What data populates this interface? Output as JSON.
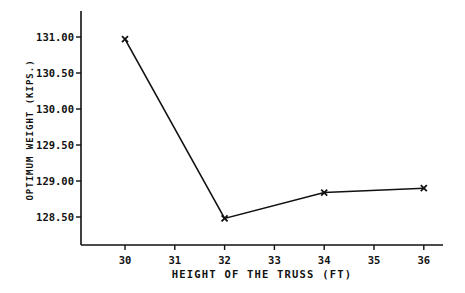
{
  "chart_data": {
    "type": "line",
    "title": "",
    "xlabel": "HEIGHT OF THE TRUSS (FT)",
    "ylabel": "OPTIMUM WEIGHT (KIPS.)",
    "x": [
      30,
      32,
      34,
      36
    ],
    "series": [
      {
        "name": "Optimum weight",
        "values": [
          130.97,
          128.48,
          128.84,
          128.9
        ],
        "marker": "x"
      }
    ],
    "xticks": [
      30,
      31,
      32,
      33,
      34,
      35,
      36
    ],
    "xtick_labels": [
      "30",
      "31",
      "32",
      "33",
      "34",
      "35",
      "36"
    ],
    "yticks": [
      128.5,
      129.0,
      129.5,
      130.0,
      130.5,
      131.0
    ],
    "ytick_labels": [
      "128.50",
      "129.00",
      "129.50",
      "130.00",
      "130.50",
      "131.00"
    ],
    "xlim": [
      29.1,
      36.4
    ],
    "ylim": [
      128.1,
      131.36
    ],
    "grid": false,
    "legend": null
  },
  "style": {
    "line_color": "#111111",
    "axis_color": "#111111"
  }
}
